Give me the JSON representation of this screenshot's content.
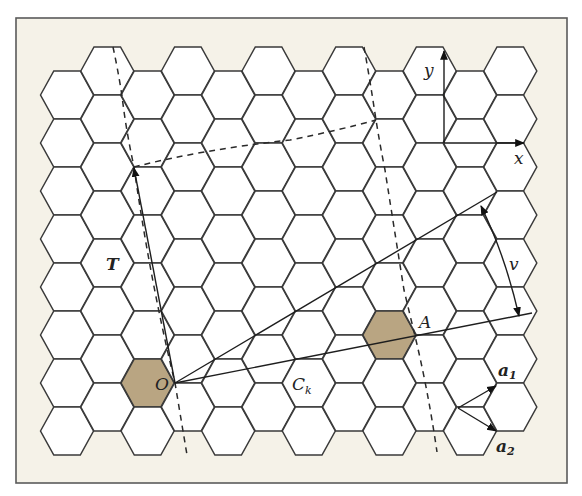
{
  "figure": {
    "colors": {
      "frame_fill": "#f5f2e8",
      "hex_fill": "#ffffff",
      "hex_stroke": "#3a3a3a",
      "shaded_hex": "#b9a582"
    },
    "labels": {
      "origin": "O",
      "point_a": "A",
      "translation": "T",
      "chiral": "C",
      "chiral_sub": "k",
      "angle": "v",
      "axis_x": "x",
      "axis_y": "y",
      "a1": "a",
      "a1_sub": "1",
      "a2": "a",
      "a2_sub": "2"
    },
    "grid": {
      "columns": 12,
      "rows_per_column": 8,
      "shaded_cells": [
        {
          "col": 2,
          "row": 6,
          "name": "O"
        },
        {
          "col": 8,
          "row": 5,
          "name": "A"
        }
      ]
    }
  }
}
